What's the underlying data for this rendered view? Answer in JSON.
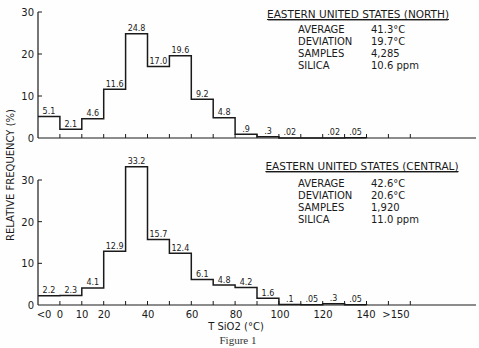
{
  "figure_caption": "Figure 1",
  "y_axis_label": "RELATIVE FREQUENCY (%)",
  "x_axis_label": "T SiO2 (°C)",
  "x_tick_labels": [
    "<0",
    "0",
    "10",
    "20",
    "40",
    "60",
    "80",
    "100",
    "120",
    "140",
    ">150"
  ],
  "panels": [
    {
      "title": "EASTERN UNITED STATES (NORTH)",
      "stats": [
        {
          "label": "AVERAGE",
          "value": "41.3°C"
        },
        {
          "label": "DEVIATION",
          "value": "19.7°C"
        },
        {
          "label": "SAMPLES",
          "value": "4,285"
        },
        {
          "label": "SILICA",
          "value": "10.6 ppm"
        }
      ],
      "y_ticks": [
        "0",
        "10",
        "20",
        "30"
      ]
    },
    {
      "title": "EASTERN UNITED STATES (CENTRAL)",
      "stats": [
        {
          "label": "AVERAGE",
          "value": "42.6°C"
        },
        {
          "label": "DEVIATION",
          "value": "20.6°C"
        },
        {
          "label": "SAMPLES",
          "value": "1,920"
        },
        {
          "label": "SILICA",
          "value": "11.0 ppm"
        }
      ],
      "y_ticks": [
        "0",
        "10",
        "20",
        "30"
      ]
    }
  ],
  "chart_data": [
    {
      "type": "bar",
      "title": "EASTERN UNITED STATES (NORTH)",
      "xlabel": "T SiO2 (°C)",
      "ylabel": "RELATIVE FREQUENCY (%)",
      "ylim": [
        0,
        30
      ],
      "grid": false,
      "categories": [
        "<0",
        "0-10",
        "10-20",
        "20-30",
        "30-40",
        "40-50",
        "50-60",
        "60-70",
        "70-80",
        "80-90",
        "90-100",
        "100-110",
        "110-120",
        "120-130",
        "130-140",
        "140-150",
        ">150"
      ],
      "values": [
        5.1,
        2.1,
        4.6,
        11.6,
        24.8,
        17.0,
        19.6,
        9.2,
        4.8,
        0.9,
        0.3,
        0.02,
        0,
        0.02,
        0.05,
        0,
        0
      ],
      "data_labels": [
        "5.1",
        "2.1",
        "4.6",
        "11.6",
        "24.8",
        "17.0",
        "19.6",
        "9.2",
        "4.8",
        ".9",
        ".3",
        ".02",
        "",
        ".02",
        ".05",
        "",
        ""
      ],
      "annotations": [
        "AVERAGE 41.3°C",
        "DEVIATION 19.7°C",
        "SAMPLES 4,285",
        "SILICA 10.6 ppm"
      ]
    },
    {
      "type": "bar",
      "title": "EASTERN UNITED STATES (CENTRAL)",
      "xlabel": "T SiO2 (°C)",
      "ylabel": "RELATIVE FREQUENCY (%)",
      "ylim": [
        0,
        30
      ],
      "grid": false,
      "categories": [
        "<0",
        "0-10",
        "10-20",
        "20-30",
        "30-40",
        "40-50",
        "50-60",
        "60-70",
        "70-80",
        "80-90",
        "90-100",
        "100-110",
        "110-120",
        "120-130",
        "130-140",
        "140-150",
        ">150"
      ],
      "values": [
        2.2,
        2.3,
        4.1,
        12.9,
        33.2,
        15.7,
        12.4,
        6.1,
        4.8,
        4.2,
        1.6,
        0.1,
        0.05,
        0.3,
        0.05,
        0,
        0
      ],
      "data_labels": [
        "2.2",
        "2.3",
        "4.1",
        "12.9",
        "33.2",
        "15.7",
        "12.4",
        "6.1",
        "4.8",
        "4.2",
        "1.6",
        ".1",
        ".05",
        ".3",
        ".05",
        "",
        ""
      ],
      "annotations": [
        "AVERAGE 42.6°C",
        "DEVIATION 20.6°C",
        "SAMPLES 1,920",
        "SILICA 11.0 ppm"
      ]
    }
  ]
}
